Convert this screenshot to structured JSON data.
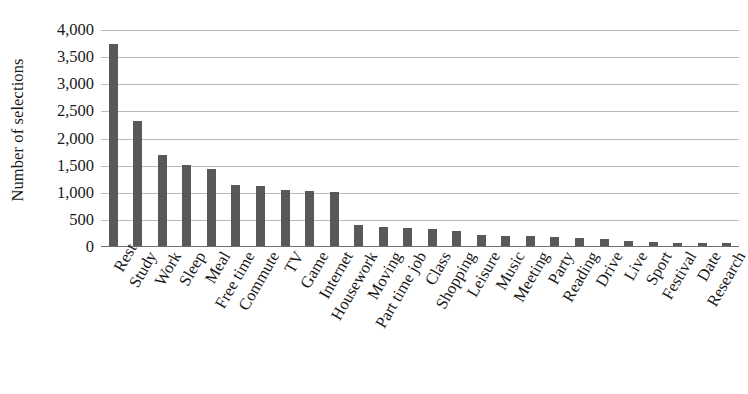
{
  "chart_data": {
    "type": "bar",
    "title": "",
    "xlabel": "",
    "ylabel": "Number of selections",
    "ylim": [
      0,
      4000
    ],
    "ytick_values": [
      0,
      500,
      1000,
      1500,
      2000,
      2500,
      3000,
      3500,
      4000
    ],
    "ytick_labels": [
      "0",
      "500",
      "1,000",
      "1,500",
      "2,000",
      "2,500",
      "3,000",
      "3,500",
      "4,000"
    ],
    "grid": true,
    "legend": "none",
    "bar_color": "#595959",
    "gridline_color": "#b9b9b9",
    "axis_color": "#6f6f6f",
    "categories": [
      "Rest",
      "Study",
      "Work",
      "Sleep",
      "Meal",
      "Free time",
      "Commute",
      "TV",
      "Game",
      "Internet",
      "Housework",
      "Moving",
      "Part time job",
      "Class",
      "Shopping",
      "Leisure",
      "Music",
      "Meeting",
      "Party",
      "Reading",
      "Drive",
      "Live",
      "Sport",
      "Festival",
      "Date",
      "Research"
    ],
    "values": [
      3740,
      2330,
      1690,
      1510,
      1430,
      1150,
      1130,
      1060,
      1040,
      1020,
      400,
      370,
      350,
      340,
      300,
      220,
      210,
      200,
      180,
      160,
      140,
      110,
      90,
      80,
      70,
      70
    ]
  }
}
